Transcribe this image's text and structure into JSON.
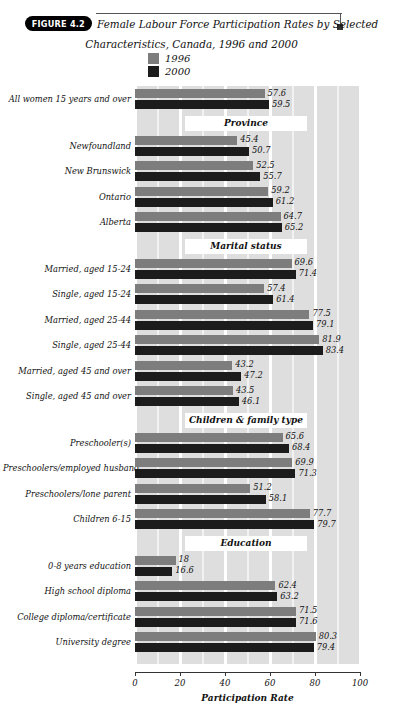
{
  "figure": {
    "badge": "FIGURE 4.2",
    "title_line_1": "Female Labour Force Participation Rates by Selected",
    "title_line_2": "Characteristics, Canada, 1996 and 2000"
  },
  "legend": {
    "items": [
      {
        "label": "1996",
        "color": "#7d7d7d"
      },
      {
        "label": "2000",
        "color": "#1c1c1c"
      }
    ]
  },
  "axis": {
    "title": "Participation Rate",
    "ticks": [
      "0",
      "20",
      "40",
      "60",
      "80",
      "100"
    ]
  },
  "chart_data": {
    "type": "bar",
    "orientation": "horizontal",
    "title": "Female Labour Force Participation Rates by Selected Characteristics, Canada, 1996 and 2000",
    "xlabel": "Participation Rate",
    "ylabel": "",
    "xlim": [
      0,
      100
    ],
    "xticks": [
      0,
      20,
      40,
      60,
      80,
      100
    ],
    "grid": true,
    "legend_position": "top-center",
    "series_names": [
      "1996",
      "2000"
    ],
    "series_colors": [
      "#7d7d7d",
      "#1c1c1c"
    ],
    "categories": [
      "All women 15 years and over",
      "Newfoundland",
      "New Brunswick",
      "Ontario",
      "Alberta",
      "Married, aged 15-24",
      "Single, aged 15-24",
      "Married, aged 25-44",
      "Single, aged 25-44",
      "Married, aged 45 and over",
      "Single, aged 45 and over",
      "Preschooler(s)",
      "Preschoolers/employed husband",
      "Preschoolers/lone parent",
      "Children 6-15",
      "0-8 years education",
      "High school diploma",
      "College diploma/certificate",
      "University degree"
    ],
    "series": [
      {
        "name": "1996",
        "values": [
          57.6,
          45.4,
          52.5,
          59.2,
          64.7,
          69.6,
          57.4,
          77.5,
          81.9,
          43.2,
          43.5,
          65.6,
          69.9,
          51.2,
          77.7,
          18,
          62.4,
          71.5,
          80.3
        ]
      },
      {
        "name": "2000",
        "values": [
          59.5,
          50.7,
          55.7,
          61.2,
          65.2,
          71.4,
          61.4,
          79.1,
          83.4,
          47.2,
          46.1,
          68.4,
          71.3,
          58.1,
          79.7,
          16.6,
          63.2,
          71.6,
          79.4
        ]
      }
    ],
    "group_headers": [
      "Province",
      "Marital status",
      "Children & family type",
      "Education"
    ]
  },
  "groups": [
    {
      "header": null,
      "rows": [
        {
          "label": "All women 15 years and over",
          "v1996": 57.6,
          "v2000": 59.5,
          "t1996": "57.6",
          "t2000": "59.5"
        }
      ]
    },
    {
      "header": "Province",
      "rows": [
        {
          "label": "Newfoundland",
          "v1996": 45.4,
          "v2000": 50.7,
          "t1996": "45.4",
          "t2000": "50.7"
        },
        {
          "label": "New Brunswick",
          "v1996": 52.5,
          "v2000": 55.7,
          "t1996": "52.5",
          "t2000": "55.7"
        },
        {
          "label": "Ontario",
          "v1996": 59.2,
          "v2000": 61.2,
          "t1996": "59.2",
          "t2000": "61.2"
        },
        {
          "label": "Alberta",
          "v1996": 64.7,
          "v2000": 65.2,
          "t1996": "64.7",
          "t2000": "65.2"
        }
      ]
    },
    {
      "header": "Marital status",
      "rows": [
        {
          "label": "Married, aged 15-24",
          "v1996": 69.6,
          "v2000": 71.4,
          "t1996": "69.6",
          "t2000": "71.4"
        },
        {
          "label": "Single, aged 15-24",
          "v1996": 57.4,
          "v2000": 61.4,
          "t1996": "57.4",
          "t2000": "61.4"
        },
        {
          "label": "Married, aged 25-44",
          "v1996": 77.5,
          "v2000": 79.1,
          "t1996": "77.5",
          "t2000": "79.1"
        },
        {
          "label": "Single, aged 25-44",
          "v1996": 81.9,
          "v2000": 83.4,
          "t1996": "81.9",
          "t2000": "83.4"
        },
        {
          "label": "Married, aged 45 and over",
          "v1996": 43.2,
          "v2000": 47.2,
          "t1996": "43.2",
          "t2000": "47.2"
        },
        {
          "label": "Single, aged 45 and over",
          "v1996": 43.5,
          "v2000": 46.1,
          "t1996": "43.5",
          "t2000": "46.1"
        }
      ]
    },
    {
      "header": "Children & family type",
      "rows": [
        {
          "label": "Preschooler(s)",
          "v1996": 65.6,
          "v2000": 68.4,
          "t1996": "65.6",
          "t2000": "68.4"
        },
        {
          "label": "Preschoolers/employed husband",
          "v1996": 69.9,
          "v2000": 71.3,
          "t1996": "69.9",
          "t2000": "71.3"
        },
        {
          "label": "Preschoolers/lone parent",
          "v1996": 51.2,
          "v2000": 58.1,
          "t1996": "51.2",
          "t2000": "58.1"
        },
        {
          "label": "Children 6-15",
          "v1996": 77.7,
          "v2000": 79.7,
          "t1996": "77.7",
          "t2000": "79.7"
        }
      ]
    },
    {
      "header": "Education",
      "rows": [
        {
          "label": "0-8 years education",
          "v1996": 18,
          "v2000": 16.6,
          "t1996": "18",
          "t2000": "16.6"
        },
        {
          "label": "High school diploma",
          "v1996": 62.4,
          "v2000": 63.2,
          "t1996": "62.4",
          "t2000": "63.2"
        },
        {
          "label": "College diploma/certificate",
          "v1996": 71.5,
          "v2000": 71.6,
          "t1996": "71.5",
          "t2000": "71.6"
        },
        {
          "label": "University degree",
          "v1996": 80.3,
          "v2000": 79.4,
          "t1996": "80.3",
          "t2000": "79.4"
        }
      ]
    }
  ]
}
